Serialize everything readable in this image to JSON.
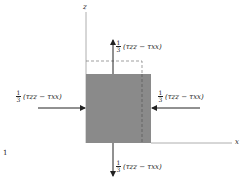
{
  "diagram": {
    "axes": {
      "vertical": "z",
      "horizontal": "x"
    },
    "margin_mark": "1",
    "forces": {
      "top": {
        "numerator": "1",
        "denominator": "3",
        "expression": "(τzz − τxx)",
        "direction": "up"
      },
      "bottom": {
        "numerator": "1",
        "denominator": "3",
        "expression": "(τzz − τxx)",
        "direction": "down"
      },
      "left": {
        "numerator": "1",
        "denominator": "3",
        "expression": "(τzz − τxx)",
        "direction": "right"
      },
      "right": {
        "numerator": "1",
        "denominator": "3",
        "expression": "(τzz − τxx)",
        "direction": "left"
      }
    },
    "colors": {
      "block": "#8a8a8a",
      "line": "#333333"
    }
  }
}
